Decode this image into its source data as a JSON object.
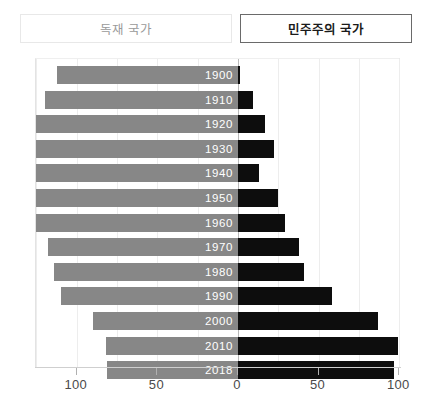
{
  "legend": {
    "autocracy_label": "독재 국가",
    "democracy_label": "민주주의 국가"
  },
  "colors": {
    "autocracy_bar": "#878787",
    "democracy_bar": "#0d0d0d",
    "grid": "#ededed",
    "zero_axis": "#b9b9b9",
    "year_label": "#ffffff",
    "tick_label": "#4a4a4a",
    "legend_inactive_text": "#9a9a9a",
    "legend_active_text": "#1a1a1a"
  },
  "axis": {
    "tick_labels": [
      "100",
      "50",
      "0",
      "50",
      "100"
    ],
    "tick_values": [
      -100,
      -50,
      0,
      50,
      100
    ],
    "min": -125,
    "max": 100,
    "gridline_step": 25
  },
  "chart_data": {
    "type": "bar",
    "orientation": "horizontal-diverging",
    "title": "",
    "subtitle": "",
    "xlabel": "",
    "ylabel": "",
    "xlim": [
      -125,
      100
    ],
    "grid": true,
    "legend_position": "top",
    "categories": [
      "1900",
      "1910",
      "1920",
      "1930",
      "1940",
      "1950",
      "1960",
      "1970",
      "1980",
      "1990",
      "2000",
      "2010",
      "2018"
    ],
    "series": [
      {
        "name": "독재 국가",
        "side": "left",
        "color": "#878787",
        "values": [
          112,
          120,
          127,
          127,
          127,
          127,
          126,
          118,
          114,
          110,
          90,
          82,
          81
        ]
      },
      {
        "name": "민주주의 국가",
        "side": "right",
        "color": "#0d0d0d",
        "values": [
          1,
          9,
          17,
          22,
          13,
          25,
          29,
          38,
          41,
          58,
          87,
          99,
          97
        ]
      }
    ],
    "rows": [
      {
        "year": "1900",
        "autocracy": 112,
        "democracy": 1
      },
      {
        "year": "1910",
        "autocracy": 120,
        "democracy": 9
      },
      {
        "year": "1920",
        "autocracy": 127,
        "democracy": 17
      },
      {
        "year": "1930",
        "autocracy": 127,
        "democracy": 22
      },
      {
        "year": "1940",
        "autocracy": 127,
        "democracy": 13
      },
      {
        "year": "1950",
        "autocracy": 127,
        "democracy": 25
      },
      {
        "year": "1960",
        "autocracy": 126,
        "democracy": 29
      },
      {
        "year": "1970",
        "autocracy": 118,
        "democracy": 38
      },
      {
        "year": "1980",
        "autocracy": 114,
        "democracy": 41
      },
      {
        "year": "1990",
        "autocracy": 110,
        "democracy": 58
      },
      {
        "year": "2000",
        "autocracy": 90,
        "democracy": 87
      },
      {
        "year": "2010",
        "autocracy": 82,
        "democracy": 99
      },
      {
        "year": "2018",
        "autocracy": 81,
        "democracy": 97
      }
    ]
  },
  "geometry": {
    "plot_left": 35,
    "plot_top": 58,
    "plot_width": 365,
    "plot_height": 309,
    "zero_x": 202,
    "px_per_unit": 1.6125,
    "row_pitch": 24.6,
    "bar_height": 18,
    "first_row_top": 7
  }
}
